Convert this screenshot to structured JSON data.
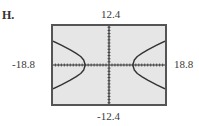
{
  "panel": {
    "label": "H."
  },
  "window": {
    "xmin": "-18.8",
    "xmax": "18.8",
    "ymin": "-12.4",
    "ymax": "12.4"
  },
  "chart_data": {
    "type": "line",
    "title": "H.",
    "xlabel": "",
    "ylabel": "",
    "xlim": [
      -18.8,
      18.8
    ],
    "ylim": [
      -12.4,
      12.4
    ],
    "tick_labels": {
      "x": [
        "-18.8",
        "18.8"
      ],
      "y": [
        "-12.4",
        "12.4"
      ]
    },
    "xscale_tick": 1,
    "yscale_tick": 1,
    "grid": false,
    "legend": null,
    "series": [
      {
        "name": "left branch",
        "x": [
          -18.8,
          -16,
          -13,
          -11,
          -9.5,
          -8.5,
          -8,
          -8.5,
          -9.5,
          -11,
          -13,
          -16,
          -18.8
        ],
        "y": [
          7.6,
          6.3,
          4.8,
          3.7,
          2.7,
          1.6,
          0,
          -1.6,
          -2.7,
          -3.7,
          -4.8,
          -6.3,
          -7.6
        ]
      },
      {
        "name": "right branch",
        "x": [
          18.8,
          16,
          13,
          11,
          9.5,
          8.5,
          8,
          8.5,
          9.5,
          11,
          13,
          16,
          18.8
        ],
        "y": [
          7.6,
          6.3,
          4.8,
          3.7,
          2.7,
          1.6,
          0,
          -1.6,
          -2.7,
          -3.7,
          -4.8,
          -6.3,
          -7.6
        ]
      }
    ],
    "estimated_equation": "x^2/64 - y^2/13 = 1",
    "vertices": [
      [
        -8,
        0
      ],
      [
        8,
        0
      ]
    ],
    "colors": {
      "screen_bg": "#e6e6e6",
      "border": "#555555",
      "curve": "#333333",
      "axes": "#333333"
    }
  }
}
